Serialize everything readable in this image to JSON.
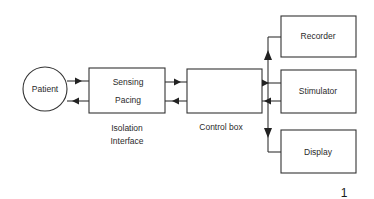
{
  "diagram": {
    "nodes": {
      "patient": {
        "label": "Patient",
        "shape": "circle"
      },
      "isolation": {
        "line1": "Sensing",
        "line2": "Pacing",
        "caption1": "Isolation",
        "caption2": "Interface"
      },
      "control": {
        "caption": "Control box"
      },
      "recorder": {
        "label": "Recorder"
      },
      "stimulator": {
        "label": "Stimulator"
      },
      "display": {
        "label": "Display"
      }
    },
    "edges": [
      {
        "from": "patient",
        "to": "isolation",
        "direction": "forward"
      },
      {
        "from": "isolation",
        "to": "patient",
        "direction": "backward"
      },
      {
        "from": "isolation",
        "to": "control",
        "direction": "forward"
      },
      {
        "from": "control",
        "to": "isolation",
        "direction": "backward"
      },
      {
        "from": "stimulator",
        "to": "control",
        "direction": "forward"
      },
      {
        "from": "control",
        "to": "stimulator",
        "direction": "backward"
      },
      {
        "from": "control",
        "to": "recorder",
        "direction": "bus-up"
      },
      {
        "from": "control",
        "to": "display",
        "direction": "bus-down"
      }
    ],
    "figure_number": "1"
  }
}
